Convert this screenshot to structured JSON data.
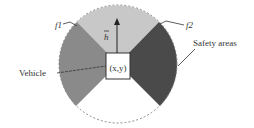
{
  "diagram": {
    "labels": {
      "f1": "f1",
      "f2": "f2",
      "heading": "h",
      "vehicle": "Vehicle",
      "safety": "Safety areas",
      "position": "(x,y)"
    },
    "colors": {
      "front_sector": "#c8c8c8",
      "left_sector": "#8a8a8a",
      "right_sector": "#4a4a4a",
      "outline": "#888888",
      "text": "#333333"
    }
  }
}
